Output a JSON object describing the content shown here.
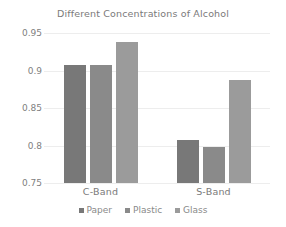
{
  "chart_data": {
    "type": "bar",
    "title": "Different Concentrations of Alcohol",
    "xlabel": "",
    "ylabel": "",
    "categories": [
      "C-Band",
      "S-Band"
    ],
    "series": [
      {
        "name": "Paper",
        "values": [
          0.908,
          0.807
        ],
        "color": "#787878"
      },
      {
        "name": "Plastic",
        "values": [
          0.908,
          0.798
        ],
        "color": "#8a8a8a"
      },
      {
        "name": "Glass",
        "values": [
          0.938,
          0.888
        ],
        "color": "#9b9b9b"
      }
    ],
    "ylim": [
      0.75,
      0.95
    ],
    "yticks": [
      "0.95",
      "0.9",
      "0.85",
      "0.8",
      "0.75"
    ],
    "ytick_values": [
      0.95,
      0.9,
      0.85,
      0.8,
      0.75
    ],
    "grid": true,
    "legend_position": "bottom"
  },
  "colors": {
    "background": "#ffffff",
    "gridline": "#ededed",
    "text": "#808080",
    "title_text": "#7a7a7a"
  }
}
